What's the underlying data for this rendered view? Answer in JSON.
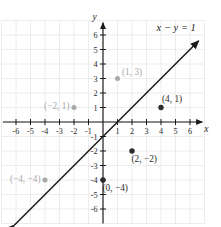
{
  "chart_data": {
    "type": "scatter",
    "title": "",
    "xlabel": "x",
    "ylabel": "y",
    "equation_label": "x − y = 1",
    "equation_slope": 1,
    "equation_intercept": -1,
    "xlim": [
      -7,
      7
    ],
    "ylim": [
      -7,
      7
    ],
    "xticks": [
      -6,
      -5,
      -4,
      -3,
      -2,
      -1,
      1,
      2,
      3,
      4,
      5,
      6
    ],
    "yticks": [
      6,
      5,
      4,
      3,
      2,
      1,
      -1,
      -2,
      -3,
      -4,
      -5,
      -6
    ],
    "xtick_labels": [
      "-6",
      "-5",
      "-4",
      "-3",
      "-2",
      "-1",
      "1",
      "2",
      "3",
      "4",
      "5",
      "6"
    ],
    "ytick_labels": [
      "6",
      "5",
      "4",
      "3",
      "2",
      "1",
      "-1",
      "-2",
      "-3",
      "-4",
      "-5",
      "-6"
    ],
    "grid": true,
    "grid_color": "#ececec",
    "legend": "none",
    "axis_color": "#1a1a1a",
    "line_color": "#1a1a1a",
    "dark_point_color": "#2b2b2b",
    "gray_point_color": "#a8a8a8",
    "line_endpoints": [
      [
        -6.1,
        -7.1
      ],
      [
        6.6,
        5.6
      ]
    ],
    "points": [
      {
        "x": 1,
        "y": 3,
        "label": "(1, 3)",
        "color": "gray",
        "label_pos": "right"
      },
      {
        "x": -2,
        "y": 1,
        "label": "(−2, 1)",
        "color": "gray",
        "label_pos": "left"
      },
      {
        "x": -4,
        "y": -4,
        "label": "(−4, −4)",
        "color": "gray",
        "label_pos": "left"
      },
      {
        "x": 4,
        "y": 1,
        "label": "(4, 1)",
        "color": "dark",
        "label_pos": "above-right"
      },
      {
        "x": 2,
        "y": -2,
        "label": "(2, −2)",
        "color": "dark",
        "label_pos": "below-right"
      },
      {
        "x": 0,
        "y": -4,
        "label": "(0, −4)",
        "color": "dark",
        "label_pos": "below-right"
      }
    ]
  },
  "figure": {
    "name": "coordinate-plane-graph",
    "x_axis_name": "x",
    "y_axis_name": "y",
    "equation": "x − y = 1"
  }
}
